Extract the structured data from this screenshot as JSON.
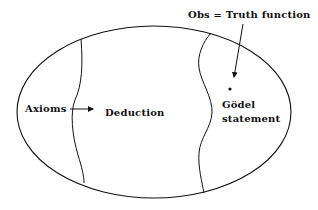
{
  "diagram": {
    "labels": {
      "obs": "Obs = Truth function",
      "axioms": "Axioms",
      "deduction": "Deduction",
      "godel_line1": "Gödel",
      "godel_line2": "statement"
    },
    "colors": {
      "stroke": "#111111",
      "background": "#ffffff"
    }
  }
}
